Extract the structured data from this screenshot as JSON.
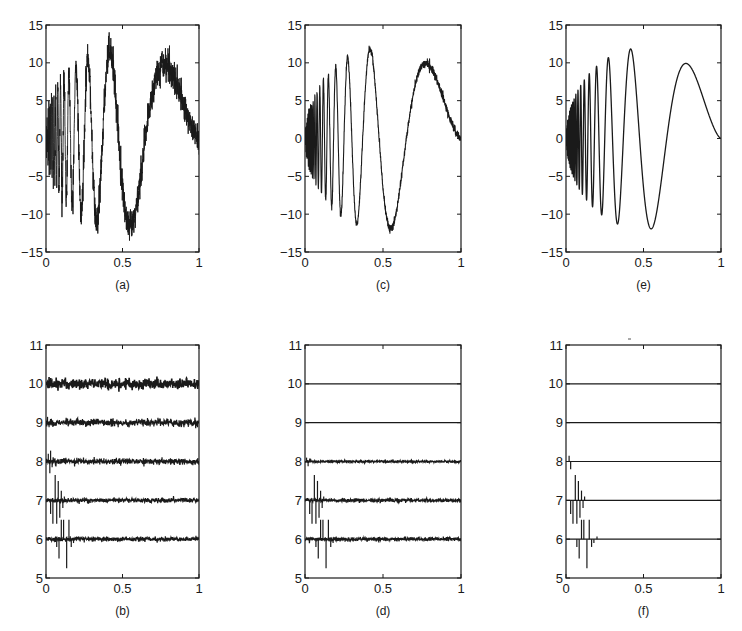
{
  "figure": {
    "layout": "2 rows x 3 columns",
    "line_color": "#1a1a1a",
    "background": "#ffffff"
  },
  "chart_data": [
    {
      "id": "a",
      "caption": "(a)",
      "type": "line",
      "description": "Noisy Doppler signal",
      "title": "",
      "xlabel": "",
      "ylabel": "",
      "xlim": [
        0,
        1
      ],
      "ylim": [
        -15,
        15
      ],
      "xticks": [
        0,
        0.5,
        1
      ],
      "xtick_labels": [
        "0",
        "0.5",
        "1"
      ],
      "yticks": [
        -15,
        -10,
        -5,
        0,
        5,
        10,
        15
      ],
      "ytick_labels": [
        "-15",
        "-10",
        "-5",
        "0",
        "5",
        "10",
        "15"
      ],
      "grid": false,
      "signal": {
        "function": "doppler",
        "amplitude": 24,
        "epsilon": 0.05,
        "noise_sd": 1.0
      },
      "key_points": [
        {
          "x": 0.28,
          "y": 12
        },
        {
          "x": 0.33,
          "y": -13.5
        },
        {
          "x": 0.43,
          "y": 14.5
        },
        {
          "x": 0.56,
          "y": -14
        },
        {
          "x": 0.78,
          "y": 11.5
        },
        {
          "x": 1.0,
          "y": 0
        }
      ]
    },
    {
      "id": "c",
      "caption": "(c)",
      "type": "line",
      "description": "Denoised signal (moderate residual noise)",
      "title": "",
      "xlabel": "",
      "ylabel": "",
      "xlim": [
        0,
        1
      ],
      "ylim": [
        -15,
        15
      ],
      "xticks": [
        0,
        0.5,
        1
      ],
      "xtick_labels": [
        "0",
        "0.5",
        "1"
      ],
      "yticks": [
        -15,
        -10,
        -5,
        0,
        5,
        10,
        15
      ],
      "ytick_labels": [
        "-15",
        "-10",
        "-5",
        "0",
        "5",
        "10",
        "15"
      ],
      "grid": false,
      "signal": {
        "function": "doppler",
        "amplitude": 24,
        "epsilon": 0.05,
        "noise_sd": 0.25
      },
      "key_points": [
        {
          "x": 0.28,
          "y": 10.8
        },
        {
          "x": 0.33,
          "y": -12.3
        },
        {
          "x": 0.43,
          "y": 12.5
        },
        {
          "x": 0.55,
          "y": -12.3
        },
        {
          "x": 0.77,
          "y": 10.3
        },
        {
          "x": 1.0,
          "y": 0
        }
      ]
    },
    {
      "id": "e",
      "caption": "(e)",
      "type": "line",
      "description": "Smooth reconstructed signal",
      "title": "",
      "xlabel": "",
      "ylabel": "",
      "xlim": [
        0,
        1
      ],
      "ylim": [
        -15,
        15
      ],
      "xticks": [
        0,
        0.5,
        1
      ],
      "xtick_labels": [
        "0",
        "0.5",
        "1"
      ],
      "yticks": [
        -15,
        -10,
        -5,
        0,
        5,
        10,
        15
      ],
      "ytick_labels": [
        "-15",
        "-10",
        "-5",
        "0",
        "5",
        "10",
        "15"
      ],
      "grid": false,
      "signal": {
        "function": "doppler",
        "amplitude": 24,
        "epsilon": 0.05,
        "noise_sd": 0.0
      },
      "key_points": [
        {
          "x": 0.28,
          "y": 10.5
        },
        {
          "x": 0.33,
          "y": -11.3
        },
        {
          "x": 0.43,
          "y": 12
        },
        {
          "x": 0.55,
          "y": -11.9
        },
        {
          "x": 0.76,
          "y": 10
        },
        {
          "x": 1.0,
          "y": 0
        }
      ]
    },
    {
      "id": "b",
      "caption": "(b)",
      "type": "line",
      "description": "Wavelet coefficients by level (offset baselines), noisy",
      "title": "",
      "xlabel": "",
      "ylabel": "",
      "xlim": [
        0,
        1
      ],
      "ylim": [
        5,
        11
      ],
      "xticks": [
        0,
        0.5,
        1
      ],
      "xtick_labels": [
        "0",
        "0.5",
        "1"
      ],
      "yticks": [
        5,
        6,
        7,
        8,
        9,
        10,
        11
      ],
      "ytick_labels": [
        "5",
        "6",
        "7",
        "8",
        "9",
        "10",
        "11"
      ],
      "grid": false,
      "series": [
        {
          "name": "level 10",
          "baseline": 10,
          "noise": 0.07,
          "spikes": []
        },
        {
          "name": "level 9",
          "baseline": 9,
          "noise": 0.05,
          "spikes": [
            {
              "x": 0.01,
              "y": 0.15
            },
            {
              "x": 0.02,
              "y": -0.12
            }
          ]
        },
        {
          "name": "level 8",
          "baseline": 8,
          "noise": 0.04,
          "spikes": [
            {
              "x": 0.015,
              "y": 0.2
            },
            {
              "x": 0.025,
              "y": -0.3
            },
            {
              "x": 0.03,
              "y": 0.28
            },
            {
              "x": 0.04,
              "y": -0.15
            }
          ]
        },
        {
          "name": "level 7",
          "baseline": 7,
          "noise": 0.03,
          "spikes": [
            {
              "x": 0.03,
              "y": -0.35
            },
            {
              "x": 0.045,
              "y": -0.6
            },
            {
              "x": 0.06,
              "y": 0.65
            },
            {
              "x": 0.07,
              "y": -0.6
            },
            {
              "x": 0.08,
              "y": 0.5
            },
            {
              "x": 0.09,
              "y": -0.45
            },
            {
              "x": 0.1,
              "y": 0.25
            },
            {
              "x": 0.11,
              "y": -0.2
            },
            {
              "x": 0.12,
              "y": 0.1
            }
          ]
        },
        {
          "name": "level 6",
          "baseline": 6,
          "noise": 0.03,
          "spikes": [
            {
              "x": 0.07,
              "y": -0.2
            },
            {
              "x": 0.085,
              "y": -0.5
            },
            {
              "x": 0.1,
              "y": 0.5
            },
            {
              "x": 0.115,
              "y": 0.5
            },
            {
              "x": 0.135,
              "y": -0.75
            },
            {
              "x": 0.15,
              "y": 0.5
            },
            {
              "x": 0.165,
              "y": -0.2
            },
            {
              "x": 0.18,
              "y": -0.1
            },
            {
              "x": 0.2,
              "y": 0.07
            }
          ]
        }
      ]
    },
    {
      "id": "d",
      "caption": "(d)",
      "type": "line",
      "description": "Wavelet coefficients by level, partially thresholded",
      "title": "",
      "xlabel": "",
      "ylabel": "",
      "xlim": [
        0,
        1
      ],
      "ylim": [
        5,
        11
      ],
      "xticks": [
        0,
        0.5,
        1
      ],
      "xtick_labels": [
        "0",
        "0.5",
        "1"
      ],
      "yticks": [
        5,
        6,
        7,
        8,
        9,
        10,
        11
      ],
      "ytick_labels": [
        "5",
        "6",
        "7",
        "8",
        "9",
        "10",
        "11"
      ],
      "grid": false,
      "series": [
        {
          "name": "level 10",
          "baseline": 10,
          "noise": 0.0,
          "spikes": []
        },
        {
          "name": "level 9",
          "baseline": 9,
          "noise": 0.0,
          "spikes": []
        },
        {
          "name": "level 8",
          "baseline": 8,
          "noise": 0.015,
          "spikes": [
            {
              "x": 0.01,
              "y": 0.1
            },
            {
              "x": 0.02,
              "y": -0.12
            },
            {
              "x": 0.03,
              "y": 0.08
            }
          ]
        },
        {
          "name": "level 7",
          "baseline": 7,
          "noise": 0.025,
          "spikes": [
            {
              "x": 0.03,
              "y": -0.35
            },
            {
              "x": 0.045,
              "y": -0.6
            },
            {
              "x": 0.06,
              "y": 0.65
            },
            {
              "x": 0.07,
              "y": -0.6
            },
            {
              "x": 0.08,
              "y": 0.5
            },
            {
              "x": 0.09,
              "y": -0.45
            },
            {
              "x": 0.1,
              "y": 0.25
            },
            {
              "x": 0.11,
              "y": -0.2
            },
            {
              "x": 0.12,
              "y": 0.1
            }
          ]
        },
        {
          "name": "level 6",
          "baseline": 6,
          "noise": 0.025,
          "spikes": [
            {
              "x": 0.07,
              "y": -0.2
            },
            {
              "x": 0.085,
              "y": -0.5
            },
            {
              "x": 0.1,
              "y": 0.5
            },
            {
              "x": 0.115,
              "y": 0.5
            },
            {
              "x": 0.135,
              "y": -0.75
            },
            {
              "x": 0.15,
              "y": 0.5
            },
            {
              "x": 0.165,
              "y": -0.2
            },
            {
              "x": 0.18,
              "y": -0.1
            },
            {
              "x": 0.2,
              "y": 0.07
            }
          ]
        }
      ]
    },
    {
      "id": "f",
      "caption": "(f)",
      "type": "line",
      "description": "Wavelet coefficients by level, fully thresholded",
      "title": "",
      "xlabel": "",
      "ylabel": "",
      "xlim": [
        0,
        1
      ],
      "ylim": [
        5,
        11
      ],
      "xticks": [
        0,
        0.5,
        1
      ],
      "xtick_labels": [
        "0",
        "0.5",
        "1"
      ],
      "yticks": [
        5,
        6,
        7,
        8,
        9,
        10,
        11
      ],
      "ytick_labels": [
        "5",
        "6",
        "7",
        "8",
        "9",
        "10",
        "11"
      ],
      "grid": false,
      "series": [
        {
          "name": "level 10",
          "baseline": 10,
          "noise": 0.0,
          "spikes": []
        },
        {
          "name": "level 9",
          "baseline": 9,
          "noise": 0.0,
          "spikes": []
        },
        {
          "name": "level 8",
          "baseline": 8,
          "noise": 0.0,
          "spikes": [
            {
              "x": 0.02,
              "y": 0.15
            },
            {
              "x": 0.03,
              "y": -0.2
            }
          ]
        },
        {
          "name": "level 7",
          "baseline": 7,
          "noise": 0.0,
          "spikes": [
            {
              "x": 0.03,
              "y": -0.35
            },
            {
              "x": 0.045,
              "y": -0.6
            },
            {
              "x": 0.06,
              "y": 0.65
            },
            {
              "x": 0.07,
              "y": -0.6
            },
            {
              "x": 0.08,
              "y": 0.5
            },
            {
              "x": 0.09,
              "y": -0.45
            },
            {
              "x": 0.1,
              "y": 0.25
            },
            {
              "x": 0.11,
              "y": -0.2
            },
            {
              "x": 0.12,
              "y": 0.1
            }
          ]
        },
        {
          "name": "level 6",
          "baseline": 6,
          "noise": 0.0,
          "spikes": [
            {
              "x": 0.07,
              "y": -0.2
            },
            {
              "x": 0.085,
              "y": -0.5
            },
            {
              "x": 0.1,
              "y": 0.5
            },
            {
              "x": 0.115,
              "y": 0.5
            },
            {
              "x": 0.135,
              "y": -0.75
            },
            {
              "x": 0.15,
              "y": 0.5
            },
            {
              "x": 0.165,
              "y": -0.2
            },
            {
              "x": 0.18,
              "y": -0.1
            },
            {
              "x": 0.2,
              "y": 0.07
            }
          ]
        }
      ]
    }
  ]
}
